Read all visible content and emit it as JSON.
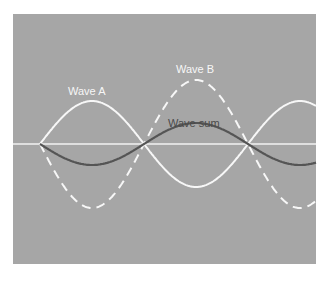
{
  "diagram": {
    "background_color": "#a6a6a6",
    "axis_color": "#f4f4f4",
    "labels": {
      "wave_a": "Wave A",
      "wave_b": "Wave B",
      "wave_sum": "Wave sum"
    },
    "waves": [
      {
        "name": "Wave A",
        "style": "solid",
        "color": "#f7f7f7",
        "amplitude": 43,
        "phase": "positive-first"
      },
      {
        "name": "Wave B",
        "style": "dashed",
        "color": "#f7f7f7",
        "amplitude": 64,
        "phase": "negative-first"
      },
      {
        "name": "Wave sum",
        "style": "solid",
        "color": "#555555",
        "amplitude": 21,
        "phase": "negative-first"
      }
    ],
    "zero_crossings_px": [
      40,
      144,
      248
    ],
    "half_period_px": 104
  }
}
